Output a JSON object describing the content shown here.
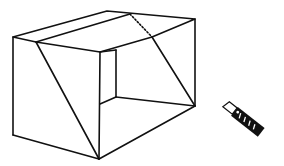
{
  "figure": {
    "stroke_color": "#111111",
    "background": "#ffffff",
    "objects": [
      {
        "name": "cut-box",
        "label": "Box cut along diagonal"
      },
      {
        "name": "utility-knife",
        "label": "Utility knife"
      }
    ],
    "box_vertices": {
      "top_left_front": [
        13,
        37
      ],
      "top_back_left": [
        107,
        11
      ],
      "top_back_right": [
        195,
        19
      ],
      "cut_start_left": [
        36,
        42
      ],
      "dotted_top": [
        130,
        14
      ],
      "cut_start_right": [
        152,
        37
      ],
      "front_top_right": [
        100,
        52
      ],
      "inner_back_top": [
        116,
        50
      ],
      "inner_back_bottom": [
        116,
        97
      ],
      "inner_front_bottom": [
        100,
        104
      ],
      "bottom_right": [
        195,
        106
      ],
      "bottom_left": [
        13,
        135
      ],
      "bottom_front": [
        99,
        159
      ]
    }
  }
}
